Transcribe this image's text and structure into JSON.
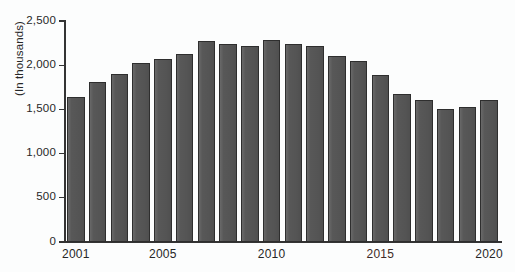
{
  "chart_data": {
    "type": "bar",
    "title": "",
    "subtitle": "",
    "xlabel": "",
    "ylabel": "(In thousands)",
    "ylim": [
      0,
      2500
    ],
    "y_ticks": [
      0,
      500,
      1000,
      1500,
      2000,
      2500
    ],
    "y_tick_labels": [
      "0",
      "500",
      "1,000",
      "1,500",
      "2,000",
      "2,500"
    ],
    "grid": false,
    "legend": null,
    "categories": [
      "2001",
      "2002",
      "2003",
      "2004",
      "2005",
      "2006",
      "2007",
      "2008",
      "2009",
      "2010",
      "2011",
      "2012",
      "2013",
      "2014",
      "2015",
      "2016",
      "2017",
      "2018",
      "2019",
      "2020"
    ],
    "x_tick_labels_shown": [
      "2001",
      "2005",
      "2010",
      "2015",
      "2020"
    ],
    "values": [
      1640,
      1805,
      1895,
      2020,
      2070,
      2125,
      2270,
      2245,
      2215,
      2290,
      2245,
      2215,
      2100,
      2045,
      1890,
      1675,
      1605,
      1510,
      1530,
      1605
    ],
    "bar_color": "#585858",
    "bar_edge_color": "#2e2e2e",
    "background_color": "#fcfdfd",
    "axis_color": "#343434",
    "text_color": "#262626",
    "tinted_label_color": "#3d2a26",
    "tinted_labels": [
      "2015"
    ]
  }
}
